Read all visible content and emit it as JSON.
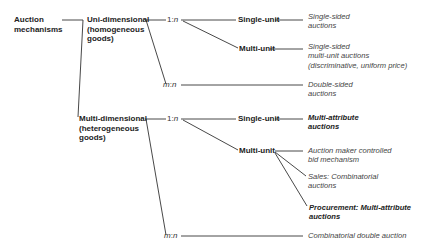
{
  "root": {
    "label_line1": "Auction",
    "label_line2": "mechanisms"
  },
  "uni": {
    "line1": "Uni-dimensional",
    "line2": "(homogeneous",
    "line3": "goods)"
  },
  "multi": {
    "line1": "Multi-dimensional",
    "line2": "(heterogeneous",
    "line3": "goods)"
  },
  "ratios": {
    "one": "1",
    "sep": ":",
    "n": "n",
    "m": "m"
  },
  "uni_branches": {
    "single_unit": "Single-unit",
    "multi_unit": "Multi-unit",
    "single_unit_leaf": {
      "line1": "Single-sided",
      "line2": "auctions"
    },
    "multi_unit_leaf": {
      "line1": "Single-sided",
      "line2": "multi-unit auctions",
      "line3": "(discriminative, uniform price)"
    },
    "mn_leaf": {
      "line1": "Double-sided",
      "line2": "auctions"
    }
  },
  "multi_branches": {
    "single_unit": "Single-unit",
    "multi_unit": "Multi-unit",
    "single_unit_leaf": {
      "line1": "Multi-attribute",
      "line2": "auctions"
    },
    "multi_unit_leaf_a": {
      "line1": "Auction maker controlled",
      "line2": "bid mechanism"
    },
    "multi_unit_leaf_b": {
      "line1": "Sales: Combinatorial",
      "line2": "auctions"
    },
    "multi_unit_leaf_c": {
      "line1": "Procurement: Multi-attribute",
      "line2": "auctions"
    },
    "mn_leaf": "Combinatorial double auction"
  },
  "colors": {
    "line": "#333333",
    "text": "#222222",
    "leaf_text": "#444444"
  }
}
